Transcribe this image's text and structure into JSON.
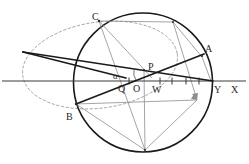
{
  "figure": {
    "type": "geometry-diagram",
    "title": "",
    "background_color": "#ffffff",
    "width": 249,
    "height": 164,
    "stroke_colors": {
      "circle": "#1a1a1a",
      "heavy_line": "#1a1a1a",
      "thin_gray": "#8a8a8a",
      "dashed_ellipse": "#9a9a9a",
      "axis": "#3a3a3a",
      "label": "#262626"
    },
    "labels": [
      {
        "id": "label-C",
        "text": "C",
        "x": 92,
        "y": 12,
        "style": "normal"
      },
      {
        "id": "label-A",
        "text": "A",
        "x": 205,
        "y": 44,
        "style": "normal"
      },
      {
        "id": "label-P",
        "text": "P",
        "x": 148,
        "y": 62,
        "style": "normal"
      },
      {
        "id": "label-alpha",
        "text": "α",
        "x": 113,
        "y": 72,
        "style": "greek"
      },
      {
        "id": "label-Q",
        "text": "Q",
        "x": 118,
        "y": 84,
        "style": "normal"
      },
      {
        "id": "label-O",
        "text": "O",
        "x": 133,
        "y": 84,
        "style": "normal"
      },
      {
        "id": "label-W",
        "text": "W",
        "x": 152,
        "y": 85,
        "style": "normal"
      },
      {
        "id": "label-Y",
        "text": "Y",
        "x": 214,
        "y": 85,
        "style": "normal"
      },
      {
        "id": "label-X",
        "text": "X",
        "x": 231,
        "y": 85,
        "style": "normal"
      },
      {
        "id": "label-B",
        "text": "B",
        "x": 66,
        "y": 112,
        "style": "normal"
      }
    ],
    "main_circle": {
      "cx": 143,
      "cy": 82.5,
      "r": 69.5
    },
    "dashed_ellipse": {
      "cx": 100,
      "cy": 65,
      "rx": 78,
      "ry": 43,
      "rotation": -8
    },
    "axis": {
      "x1": 2,
      "y1": 81,
      "x2": 246,
      "y2": 81
    },
    "axis_ticks_x": [
      129,
      160,
      172,
      186,
      199,
      211
    ],
    "points": {
      "C": {
        "x": 99,
        "y": 21
      },
      "A": {
        "x": 199,
        "y": 52
      },
      "P": {
        "x": 144,
        "y": 70
      },
      "Q": {
        "x": 124,
        "y": 77
      },
      "O": {
        "x": 138,
        "y": 78
      },
      "W": {
        "x": 152,
        "y": 78
      },
      "Y": {
        "x": 211,
        "y": 81
      },
      "X": {
        "x": 241,
        "y": 81
      },
      "B": {
        "x": 76,
        "y": 104
      },
      "top": {
        "x": 173,
        "y": 22
      },
      "bottom": {
        "x": 145,
        "y": 150
      },
      "right": {
        "x": 197,
        "y": 100
      },
      "far_left": {
        "x": 23,
        "y": 52
      }
    }
  }
}
